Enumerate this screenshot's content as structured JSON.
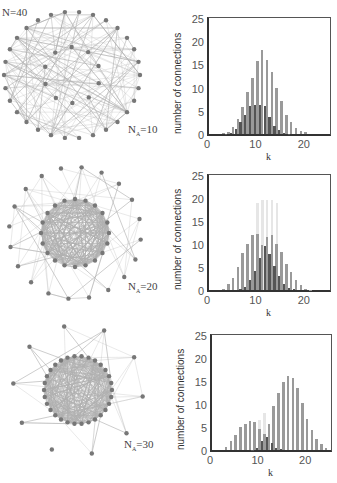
{
  "panels": [
    {
      "network_label_prefix": "N",
      "network_label_sub": "A",
      "network_label_value": "=10",
      "total_label": "N=40"
    },
    {
      "network_label_prefix": "N",
      "network_label_sub": "A",
      "network_label_value": "=20"
    },
    {
      "network_label_prefix": "N",
      "network_label_sub": "A",
      "network_label_value": "=30"
    }
  ],
  "colors": {
    "light_series": "#9a9a9a",
    "dark_series": "#555555",
    "faint_series": "#e6e6e6",
    "node": "#777777",
    "edge": "#b0b0b0",
    "axis": "#333333"
  },
  "chart_data": [
    {
      "type": "bar",
      "title": "",
      "xlabel": "k",
      "ylabel": "number of connections",
      "xlim": [
        0,
        25
      ],
      "ylim": [
        0,
        25
      ],
      "xticks": [
        "0",
        "10",
        "20"
      ],
      "yticks": [
        "0",
        "5",
        "10",
        "15",
        "20",
        "25"
      ],
      "x": [
        1,
        2,
        3,
        4,
        5,
        6,
        7,
        8,
        9,
        10,
        11,
        12,
        13,
        14,
        15,
        16,
        17,
        18,
        19,
        20,
        21,
        22,
        23,
        24
      ],
      "series": [
        {
          "name": "light (tall)",
          "values": [
            0,
            0,
            0.2,
            0.4,
            1.5,
            3.2,
            5.8,
            9,
            12,
            15.8,
            18,
            16,
            13.3,
            10,
            7.2,
            4,
            2.5,
            1.2,
            0.6,
            0.4,
            0,
            0,
            0,
            0
          ]
        },
        {
          "name": "dark (short)",
          "values": [
            0,
            0,
            0.1,
            0.3,
            1,
            2.6,
            4.2,
            6,
            6.2,
            6.2,
            6,
            3.6,
            1.8,
            0.8,
            0.3,
            0.1,
            0,
            0,
            0,
            0,
            0,
            0,
            0,
            0
          ]
        }
      ]
    },
    {
      "type": "bar",
      "title": "",
      "xlabel": "k",
      "ylabel": "number of connections",
      "xlim": [
        0,
        25
      ],
      "ylim": [
        0,
        25
      ],
      "xticks": [
        "0",
        "10",
        "20"
      ],
      "yticks": [
        "0",
        "5",
        "10",
        "15",
        "20",
        "25"
      ],
      "x": [
        1,
        2,
        3,
        4,
        5,
        6,
        7,
        8,
        9,
        10,
        11,
        12,
        13,
        14,
        15,
        16,
        17,
        18,
        19,
        20,
        21,
        22,
        23,
        24
      ],
      "series": [
        {
          "name": "faint background",
          "values": [
            0,
            0,
            0,
            0,
            0,
            0,
            0,
            0,
            2,
            19,
            19.5,
            19.5,
            19.5,
            19,
            0,
            0,
            0,
            0,
            0,
            0,
            0,
            0,
            0,
            0
          ]
        },
        {
          "name": "light (tall)",
          "values": [
            0,
            0,
            0.3,
            1.2,
            2.6,
            5,
            8,
            10,
            12,
            12.2,
            9.8,
            11.5,
            12,
            10,
            8.2,
            5.7,
            4,
            2.2,
            1,
            0.3,
            0.1,
            0,
            0,
            0
          ]
        },
        {
          "name": "dark (short)",
          "values": [
            0,
            0,
            0,
            0,
            0,
            0.2,
            0.6,
            2.2,
            4.2,
            7,
            9.5,
            7.8,
            5.3,
            3,
            1.2,
            0.5,
            0.2,
            0,
            0,
            0,
            0,
            0,
            0,
            0
          ]
        }
      ]
    },
    {
      "type": "bar",
      "title": "",
      "xlabel": "k",
      "ylabel": "number of connections",
      "xlim": [
        0,
        25
      ],
      "ylim": [
        0,
        25
      ],
      "xticks": [
        "0",
        "10",
        "20"
      ],
      "yticks": [
        "0",
        "5",
        "10",
        "15",
        "20",
        "25"
      ],
      "x": [
        1,
        2,
        3,
        4,
        5,
        6,
        7,
        8,
        9,
        10,
        11,
        12,
        13,
        14,
        15,
        16,
        17,
        18,
        19,
        20,
        21,
        22,
        23,
        24
      ],
      "series": [
        {
          "name": "faint background",
          "values": [
            0,
            0,
            0,
            0,
            0,
            0,
            0,
            6.2,
            6,
            6.5,
            8,
            0,
            0,
            0,
            0,
            0,
            0,
            0,
            0,
            0,
            0,
            0,
            0,
            0
          ]
        },
        {
          "name": "light (tall)",
          "values": [
            0,
            0,
            0.6,
            2,
            3.2,
            4.9,
            5.7,
            6.4,
            6,
            4.5,
            3.4,
            5.6,
            9.6,
            12.4,
            14.8,
            16,
            15.6,
            13.4,
            10.2,
            6.8,
            4.4,
            2.3,
            1.2,
            0.5
          ]
        },
        {
          "name": "dark (short)",
          "values": [
            0,
            0,
            0,
            0,
            0,
            0,
            0,
            0.1,
            0.5,
            2,
            2.9,
            1.5,
            0.5,
            0.2,
            0,
            0,
            0,
            0,
            0,
            0,
            0,
            0,
            0,
            0
          ]
        }
      ]
    }
  ]
}
